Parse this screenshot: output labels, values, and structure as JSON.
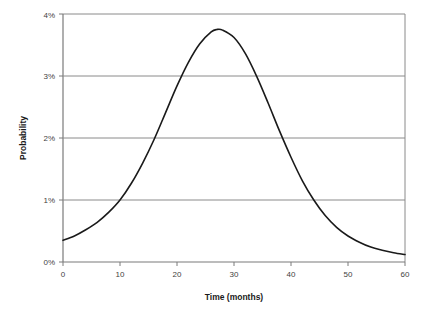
{
  "chart_data": {
    "type": "line",
    "title": "",
    "xlabel": "Time (months)",
    "ylabel": "Probability",
    "xlim": [
      0,
      60
    ],
    "ylim": [
      0,
      0.04
    ],
    "xticks": [
      0,
      10,
      20,
      30,
      40,
      50,
      60
    ],
    "xtick_labels": [
      "0",
      "10",
      "20",
      "30",
      "40",
      "50",
      "60"
    ],
    "yticks": [
      0,
      0.01,
      0.02,
      0.03,
      0.04
    ],
    "ytick_labels": [
      "0%",
      "1%",
      "2%",
      "3%",
      "4%"
    ],
    "grid": {
      "horizontal": true,
      "vertical": false
    },
    "legend": {
      "visible": false
    },
    "series": [
      {
        "name": "probability-density",
        "color": "#1a1a1a",
        "line_width": 1.6,
        "x": [
          0,
          2,
          4,
          6,
          8,
          10,
          12,
          14,
          16,
          18,
          20,
          22,
          24,
          26,
          27,
          28,
          30,
          32,
          34,
          36,
          38,
          40,
          42,
          44,
          46,
          48,
          50,
          52,
          54,
          56,
          58,
          60
        ],
        "y": [
          0.0035,
          0.0042,
          0.0052,
          0.0064,
          0.008,
          0.01,
          0.0127,
          0.016,
          0.0198,
          0.0241,
          0.0284,
          0.0322,
          0.0352,
          0.0371,
          0.0375,
          0.0374,
          0.0362,
          0.0336,
          0.0299,
          0.0256,
          0.0211,
          0.0169,
          0.0131,
          0.01,
          0.0075,
          0.0056,
          0.0042,
          0.0032,
          0.0024,
          0.0019,
          0.0015,
          0.0012
        ]
      }
    ],
    "annotations": {
      "peak_value": "3.75%",
      "peak_time": "27"
    }
  },
  "axes": {
    "x_title": "Time (months)",
    "y_title": "Probability"
  },
  "colors": {
    "line": "#1a1a1a",
    "grid": "#808080",
    "axis": "#808080",
    "background": "#ffffff",
    "tick_text": "#3f3f3f"
  }
}
